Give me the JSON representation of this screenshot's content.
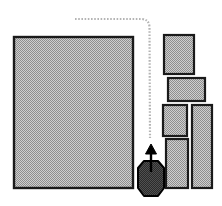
{
  "diagram": {
    "canvas": {
      "width": 222,
      "height": 206,
      "background": "#ffffff"
    },
    "style": {
      "block_fill": "#9b9b9b",
      "block_hatch_light": "#d4d4d4",
      "block_stroke": "#1a1a1a",
      "block_stroke_width": 2.2,
      "path_color": "#b4b4b4",
      "path_width": 2.2,
      "path_dash": "1.6 1.6",
      "mover_fill": "#2e2e2e",
      "mover_stroke": "#000000",
      "arrow_color": "#000000"
    },
    "blocks": [
      {
        "id": "block-main",
        "label": "main-block",
        "x": 14,
        "y": 37,
        "width": 119,
        "height": 151
      },
      {
        "id": "block-r1",
        "label": "right-block-1",
        "x": 164,
        "y": 35,
        "width": 30,
        "height": 39
      },
      {
        "id": "block-r2",
        "label": "right-block-2",
        "x": 168,
        "y": 78,
        "width": 37,
        "height": 23
      },
      {
        "id": "block-r3",
        "label": "right-block-3",
        "x": 163,
        "y": 105,
        "width": 24,
        "height": 31
      },
      {
        "id": "block-r4",
        "label": "right-block-4",
        "x": 192,
        "y": 105,
        "width": 20,
        "height": 83
      },
      {
        "id": "block-r5",
        "label": "right-block-5",
        "x": 166,
        "y": 139,
        "width": 22,
        "height": 49
      }
    ],
    "path": {
      "id": "guide-path",
      "label": "dotted-guide-path",
      "start": {
        "x": 75,
        "y": 19
      },
      "corner": {
        "x": 148,
        "y": 19
      },
      "end": {
        "x": 150,
        "y": 138
      },
      "d": "M 75 19 L 142 19 Q 149 19.5 149.5 27 L 150 138"
    },
    "mover": {
      "id": "mover-unit",
      "label": "mover-unit",
      "center_x": 151,
      "body_top": 160,
      "body_bottom": 196,
      "body_width": 26,
      "arrow": {
        "tip_y": 145,
        "tail_y": 172,
        "head_width": 11,
        "head_height": 9,
        "shaft_width": 2
      }
    }
  }
}
